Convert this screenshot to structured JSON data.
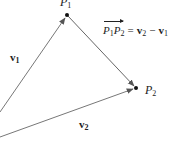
{
  "diagram": {
    "type": "vector-difference",
    "points": {
      "P1": {
        "name": "P",
        "sub": "1",
        "x": 67,
        "y": 15
      },
      "P2": {
        "name": "P",
        "sub": "2",
        "x": 136,
        "y": 88
      }
    },
    "vectors": {
      "v1": {
        "name": "v",
        "sub": "1",
        "from": [
          0,
          112
        ],
        "to": "P1"
      },
      "v2": {
        "name": "v",
        "sub": "2",
        "from": [
          0,
          137
        ],
        "to": "P2"
      },
      "P1P2": {
        "from": "P1",
        "to": "P2"
      }
    },
    "equation": {
      "lhs_a": "P",
      "lhs_a_sub": "1",
      "lhs_b": "P",
      "lhs_b_sub": "2",
      "equals": "=",
      "rhs_a": "v",
      "rhs_a_sub": "2",
      "minus": "−",
      "rhs_b": "v",
      "rhs_b_sub": "1"
    },
    "colors": {
      "line": "#666666",
      "ink": "#222222"
    }
  }
}
